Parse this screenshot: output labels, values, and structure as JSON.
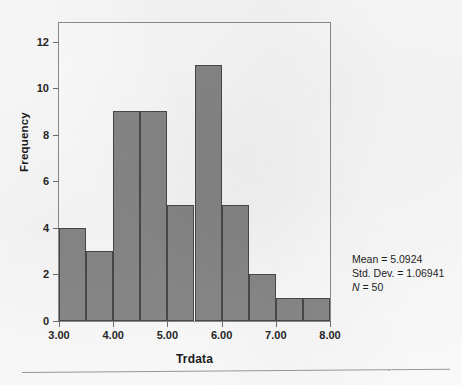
{
  "figure": {
    "kind": "histogram",
    "background_color": "#ffffff",
    "frame_color": "#8d8d8d",
    "bar_fill_color": "#8a8a8a",
    "bar_outline_color": "#4a4a4a"
  },
  "annotations": {
    "mean_line": "Mean = 5.0924",
    "std_dev_line": "Std. Dev. = 1.06941",
    "n_symbol": "N",
    "n_value": " = 50"
  },
  "chart_data": {
    "type": "bar",
    "title": "",
    "subtitle": "",
    "xlabel": "Trdata",
    "ylabel": "Frequency",
    "grid": false,
    "legend": "none",
    "bin_width": 0.5,
    "bin_starts": [
      3.0,
      3.5,
      4.0,
      4.5,
      5.0,
      5.5,
      6.0,
      6.5,
      7.0,
      7.5
    ],
    "bin_ends": [
      3.5,
      4.0,
      4.5,
      5.0,
      5.5,
      6.0,
      6.5,
      7.0,
      7.5,
      8.0
    ],
    "categories": [
      "3.00-3.50",
      "3.50-4.00",
      "4.00-4.50",
      "4.50-5.00",
      "5.00-5.50",
      "5.50-6.00",
      "6.00-6.50",
      "6.50-7.00",
      "7.00-7.50",
      "7.50-8.00"
    ],
    "values": [
      4,
      3,
      9,
      9,
      5,
      11,
      5,
      2,
      1,
      1
    ],
    "xlim": [
      3.0,
      8.0
    ],
    "ylim": [
      0,
      12.8
    ],
    "xticks": [
      3.0,
      4.0,
      5.0,
      6.0,
      7.0,
      8.0
    ],
    "xtick_labels": [
      "3.00",
      "4.00",
      "5.00",
      "6.00",
      "7.00",
      "8.00"
    ],
    "yticks": [
      0,
      2,
      4,
      6,
      8,
      10,
      12
    ],
    "ytick_labels": [
      "0",
      "2",
      "4",
      "6",
      "8",
      "10",
      "12"
    ],
    "statistics": {
      "mean": 5.0924,
      "std_dev": 1.06941,
      "n": 50
    }
  }
}
